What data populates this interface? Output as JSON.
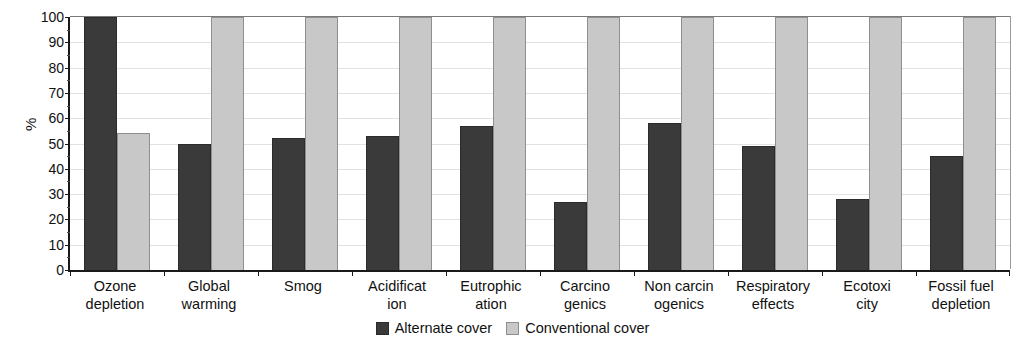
{
  "chart_data": {
    "type": "bar",
    "title": "",
    "xlabel": "",
    "ylabel": "%",
    "ylim": [
      0,
      100
    ],
    "ytick_step": 10,
    "yticks": [
      0,
      10,
      20,
      30,
      40,
      50,
      60,
      70,
      80,
      90,
      100
    ],
    "ytick_labels": [
      "0",
      "10",
      "20",
      "30",
      "40",
      "50",
      "60",
      "70",
      "80",
      "90",
      "100"
    ],
    "grid": true,
    "legend_position": "bottom-center",
    "categories": [
      "Ozone depletion",
      "Global warming",
      "Smog",
      "Acidification",
      "Eutrophication",
      "Carcinogenics",
      "Non carcinogenics",
      "Respiratory effects",
      "Ecotoxicity",
      "Fossil fuel depletion"
    ],
    "category_lines": [
      [
        "Ozone",
        "depletion"
      ],
      [
        "Global",
        "warming"
      ],
      [
        "Smog",
        ""
      ],
      [
        "Acidificat",
        "ion"
      ],
      [
        "Eutrophic",
        "ation"
      ],
      [
        "Carcino",
        "genics"
      ],
      [
        "Non carcin",
        "ogenics"
      ],
      [
        "Respiratory",
        "effects"
      ],
      [
        "Ecotoxi",
        "city"
      ],
      [
        "Fossil fuel",
        "depletion"
      ]
    ],
    "series": [
      {
        "name": "Alternate cover",
        "color": "#3a3a3a",
        "values": [
          100,
          50,
          52,
          53,
          57,
          27,
          58,
          49,
          28,
          45
        ]
      },
      {
        "name": "Conventional cover",
        "color": "#c8c8c8",
        "values": [
          54,
          100,
          100,
          100,
          100,
          100,
          100,
          100,
          100,
          100
        ]
      }
    ]
  },
  "legend": {
    "items": [
      {
        "label": "Alternate cover"
      },
      {
        "label": "Conventional cover"
      }
    ]
  }
}
